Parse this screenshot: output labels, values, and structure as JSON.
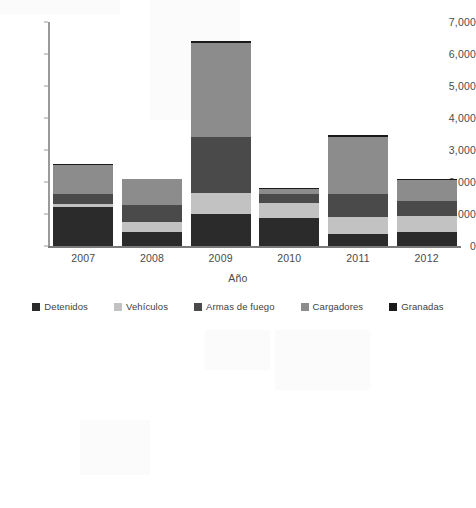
{
  "chart_data": {
    "type": "bar",
    "subtype": "stacked-bar",
    "title": "",
    "xlabel": "Año",
    "ylabel": "",
    "categories": [
      "2007",
      "2008",
      "2009",
      "2010",
      "2011",
      "2012"
    ],
    "ylim": [
      0,
      7000
    ],
    "y_ticks": [
      0,
      1000,
      2000,
      3000,
      4000,
      5000,
      6000,
      7000
    ],
    "y_tick_labels": [
      "0",
      "1,000",
      "2,000",
      "3,000",
      "4,000",
      "5,000",
      "6,000",
      "7,000"
    ],
    "grid": false,
    "legend_position": "bottom",
    "series": [
      {
        "name": "Detenidos",
        "color": "#2b2b2b",
        "values": [
          1230,
          450,
          1000,
          880,
          370,
          440
        ]
      },
      {
        "name": "Vehículos",
        "color": "#c2c2c2",
        "values": [
          85,
          300,
          650,
          450,
          530,
          490
        ]
      },
      {
        "name": "Armas de fuego",
        "color": "#4a4a4a",
        "values": [
          310,
          520,
          1750,
          290,
          740,
          470
        ]
      },
      {
        "name": "Cargadores",
        "color": "#8c8c8c",
        "values": [
          900,
          810,
          2950,
          170,
          1780,
          650
        ]
      },
      {
        "name": "Granadas",
        "color": "#1a1a1a",
        "values": [
          40,
          30,
          60,
          30,
          40,
          30
        ]
      }
    ],
    "totals": [
      2565,
      2110,
      6410,
      1820,
      3460,
      2080
    ]
  }
}
